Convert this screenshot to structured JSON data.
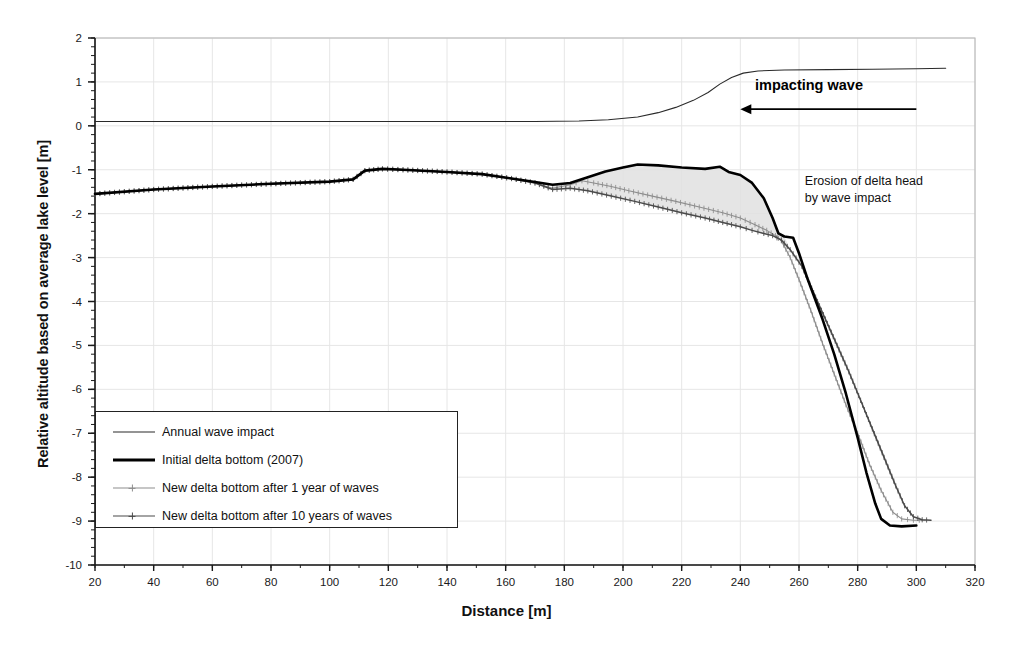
{
  "chart_data": {
    "type": "line",
    "title": "",
    "xlabel": "Distance [m]",
    "ylabel": "Relative altitude based on average lake level [m]",
    "xlim": [
      20,
      320
    ],
    "ylim": [
      -10,
      2
    ],
    "xticks": [
      20,
      40,
      60,
      80,
      100,
      120,
      140,
      160,
      180,
      200,
      220,
      240,
      260,
      280,
      300,
      320
    ],
    "yticks": [
      2,
      1,
      0,
      -1,
      -2,
      -3,
      -4,
      -5,
      -6,
      -7,
      -8,
      -9,
      -10
    ],
    "xtick_labels": [
      "20",
      "40",
      "60",
      "80",
      "100",
      "120",
      "140",
      "160",
      "180",
      "200",
      "220",
      "240",
      "260",
      "280",
      "300",
      "320"
    ],
    "ytick_labels": [
      "2",
      "1",
      "0",
      "-1",
      "-2",
      "-3",
      "-4",
      "-5",
      "-6",
      "-7",
      "-8",
      "-9",
      "-10"
    ],
    "x_minor_tick_step": 10,
    "y_minor_tick_step": 0.2,
    "grid": true,
    "grid_color": "#e6e6e6",
    "legend_position": "lower-left",
    "series": [
      {
        "name": "Annual wave impact",
        "color": "#2a2a2a",
        "style": "thin-line",
        "points": [
          [
            20,
            0.1
          ],
          [
            60,
            0.1
          ],
          [
            100,
            0.1
          ],
          [
            140,
            0.1
          ],
          [
            170,
            0.1
          ],
          [
            185,
            0.11
          ],
          [
            195,
            0.14
          ],
          [
            205,
            0.2
          ],
          [
            212,
            0.3
          ],
          [
            218,
            0.42
          ],
          [
            224,
            0.58
          ],
          [
            229,
            0.76
          ],
          [
            233,
            0.95
          ],
          [
            237,
            1.1
          ],
          [
            241,
            1.2
          ],
          [
            246,
            1.25
          ],
          [
            255,
            1.27
          ],
          [
            270,
            1.28
          ],
          [
            285,
            1.29
          ],
          [
            300,
            1.3
          ],
          [
            310,
            1.31
          ]
        ]
      },
      {
        "name": "Initial delta bottom (2007)",
        "color": "#000000",
        "style": "thick-line",
        "points": [
          [
            20,
            -1.55
          ],
          [
            40,
            -1.45
          ],
          [
            60,
            -1.38
          ],
          [
            80,
            -1.32
          ],
          [
            100,
            -1.27
          ],
          [
            108,
            -1.22
          ],
          [
            112,
            -1.02
          ],
          [
            118,
            -0.98
          ],
          [
            125,
            -1.0
          ],
          [
            140,
            -1.05
          ],
          [
            152,
            -1.1
          ],
          [
            162,
            -1.2
          ],
          [
            170,
            -1.28
          ],
          [
            176,
            -1.34
          ],
          [
            182,
            -1.3
          ],
          [
            188,
            -1.17
          ],
          [
            194,
            -1.04
          ],
          [
            200,
            -0.95
          ],
          [
            205,
            -0.88
          ],
          [
            212,
            -0.9
          ],
          [
            220,
            -0.95
          ],
          [
            228,
            -0.98
          ],
          [
            233,
            -0.93
          ],
          [
            236,
            -1.05
          ],
          [
            240,
            -1.12
          ],
          [
            244,
            -1.3
          ],
          [
            248,
            -1.65
          ],
          [
            251,
            -2.1
          ],
          [
            253,
            -2.45
          ],
          [
            255,
            -2.52
          ],
          [
            258,
            -2.55
          ],
          [
            260,
            -2.9
          ],
          [
            263,
            -3.5
          ],
          [
            268,
            -4.4
          ],
          [
            272,
            -5.2
          ],
          [
            276,
            -6.1
          ],
          [
            280,
            -7.1
          ],
          [
            283,
            -7.9
          ],
          [
            286,
            -8.6
          ],
          [
            288,
            -8.95
          ],
          [
            291,
            -9.1
          ],
          [
            295,
            -9.12
          ],
          [
            300,
            -9.1
          ]
        ]
      },
      {
        "name": "New delta bottom after 1 year of waves",
        "color": "#8d8d8d",
        "style": "cross-marker-line",
        "points": [
          [
            20,
            -1.55
          ],
          [
            40,
            -1.45
          ],
          [
            60,
            -1.38
          ],
          [
            80,
            -1.32
          ],
          [
            100,
            -1.27
          ],
          [
            108,
            -1.22
          ],
          [
            112,
            -1.02
          ],
          [
            118,
            -0.98
          ],
          [
            125,
            -1.0
          ],
          [
            140,
            -1.05
          ],
          [
            152,
            -1.1
          ],
          [
            162,
            -1.2
          ],
          [
            170,
            -1.3
          ],
          [
            176,
            -1.42
          ],
          [
            182,
            -1.34
          ],
          [
            186,
            -1.25
          ],
          [
            190,
            -1.3
          ],
          [
            196,
            -1.38
          ],
          [
            202,
            -1.48
          ],
          [
            210,
            -1.6
          ],
          [
            218,
            -1.72
          ],
          [
            226,
            -1.85
          ],
          [
            234,
            -1.98
          ],
          [
            240,
            -2.1
          ],
          [
            245,
            -2.25
          ],
          [
            249,
            -2.38
          ],
          [
            252,
            -2.5
          ],
          [
            254,
            -2.62
          ],
          [
            257,
            -3.0
          ],
          [
            260,
            -3.5
          ],
          [
            264,
            -4.2
          ],
          [
            268,
            -4.95
          ],
          [
            272,
            -5.65
          ],
          [
            276,
            -6.35
          ],
          [
            280,
            -7.0
          ],
          [
            284,
            -7.7
          ],
          [
            288,
            -8.3
          ],
          [
            292,
            -8.8
          ],
          [
            295,
            -8.95
          ],
          [
            299,
            -8.98
          ],
          [
            303,
            -8.98
          ]
        ]
      },
      {
        "name": "New delta bottom after 10 years of waves",
        "color": "#4a4a4a",
        "style": "cross-marker-line-dark",
        "points": [
          [
            20,
            -1.55
          ],
          [
            40,
            -1.45
          ],
          [
            60,
            -1.38
          ],
          [
            80,
            -1.32
          ],
          [
            100,
            -1.27
          ],
          [
            108,
            -1.22
          ],
          [
            112,
            -1.02
          ],
          [
            118,
            -0.98
          ],
          [
            125,
            -1.0
          ],
          [
            140,
            -1.05
          ],
          [
            152,
            -1.1
          ],
          [
            162,
            -1.2
          ],
          [
            170,
            -1.3
          ],
          [
            176,
            -1.45
          ],
          [
            182,
            -1.42
          ],
          [
            188,
            -1.48
          ],
          [
            196,
            -1.6
          ],
          [
            204,
            -1.72
          ],
          [
            212,
            -1.85
          ],
          [
            220,
            -1.98
          ],
          [
            228,
            -2.1
          ],
          [
            234,
            -2.2
          ],
          [
            240,
            -2.3
          ],
          [
            244,
            -2.38
          ],
          [
            248,
            -2.45
          ],
          [
            251,
            -2.5
          ],
          [
            254,
            -2.6
          ],
          [
            257,
            -2.82
          ],
          [
            261,
            -3.2
          ],
          [
            265,
            -3.8
          ],
          [
            269,
            -4.4
          ],
          [
            273,
            -5.0
          ],
          [
            277,
            -5.6
          ],
          [
            281,
            -6.25
          ],
          [
            285,
            -6.9
          ],
          [
            289,
            -7.55
          ],
          [
            293,
            -8.2
          ],
          [
            296,
            -8.65
          ],
          [
            299,
            -8.9
          ],
          [
            302,
            -8.97
          ],
          [
            305,
            -8.98
          ]
        ]
      }
    ],
    "shaded_region": {
      "label": "Eroded volume between initial and new delta bottom",
      "fill": "#e0e0e0",
      "x_range": [
        176,
        257
      ]
    },
    "annotations": [
      {
        "name": "impacting-wave",
        "text": "impacting wave",
        "x": 245,
        "y": 0.88,
        "bold": true,
        "arrow": {
          "from_x": 300,
          "to_x": 240,
          "y": 0.38,
          "direction": "left"
        }
      },
      {
        "name": "erosion-note",
        "text": "Erosion of delta head\nby wave impact",
        "x": 262,
        "y": -1.25,
        "bold": false
      }
    ]
  },
  "axes": {
    "x_title": "Distance [m]",
    "y_title": "Relative altitude based on average lake level [m]"
  },
  "legend": {
    "items": [
      {
        "label": "Annual wave impact",
        "swatch": "thin-line-swatch"
      },
      {
        "label": "Initial delta bottom (2007)",
        "swatch": "thick-line-swatch"
      },
      {
        "label": "New delta bottom after 1 year of waves",
        "swatch": "cross-light-swatch"
      },
      {
        "label": "New delta bottom after 10 years of waves",
        "swatch": "cross-dark-swatch"
      }
    ]
  },
  "annotations": {
    "impacting_wave": "impacting wave",
    "erosion_line1": "Erosion of delta head",
    "erosion_line2": "by wave impact"
  }
}
